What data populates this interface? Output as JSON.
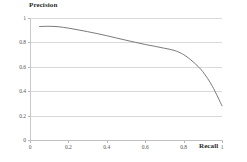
{
  "chart_data": {
    "type": "line",
    "title": "",
    "xlabel": "Recall",
    "ylabel": "Precision",
    "xlim": [
      0,
      1
    ],
    "ylim": [
      0,
      1
    ],
    "grid": true,
    "grid_axis": "y",
    "legend": false,
    "line_color": "#6b6b6b",
    "grid_color": "#d9d9d9",
    "background": "#ffffff",
    "xticks": [
      "0",
      "0.2",
      "0.4",
      "0.6",
      "0.8",
      "1"
    ],
    "xtick_values": [
      0,
      0.2,
      0.4,
      0.6,
      0.8,
      1
    ],
    "yticks": [
      "0",
      "0.2",
      "0.4",
      "0.6",
      "0.8",
      "1"
    ],
    "ytick_values": [
      0,
      0.2,
      0.4,
      0.6,
      0.8,
      1
    ],
    "series": [
      {
        "name": "precision-recall",
        "x": [
          0.05,
          0.1,
          0.15,
          0.2,
          0.25,
          0.3,
          0.35,
          0.4,
          0.45,
          0.5,
          0.55,
          0.6,
          0.65,
          0.7,
          0.75,
          0.8,
          0.85,
          0.9,
          0.95,
          1.0
        ],
        "y": [
          0.93,
          0.932,
          0.928,
          0.917,
          0.903,
          0.888,
          0.872,
          0.855,
          0.836,
          0.818,
          0.8,
          0.783,
          0.768,
          0.752,
          0.735,
          0.7,
          0.64,
          0.56,
          0.44,
          0.28
        ]
      }
    ]
  },
  "axis_titles": {
    "y": "Precision",
    "x": "Recall"
  }
}
